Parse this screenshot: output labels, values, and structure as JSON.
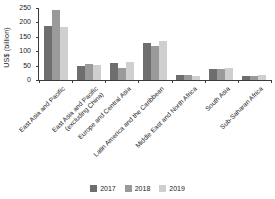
{
  "chart_data": {
    "type": "bar",
    "title": "",
    "xlabel": "",
    "ylabel": "US$ (billion)",
    "ylim": [
      0,
      250
    ],
    "yticks": [
      0,
      50,
      100,
      150,
      200,
      250
    ],
    "grid": false,
    "legend_position": "bottom",
    "categories": [
      "East Asia and Pacific",
      "East Asia and Pacific (excluding China)",
      "Europe and Central Asia",
      "Latin America and the Caribbean",
      "Middle East and North Africa",
      "South Asia",
      "Sub-Saharan Africa"
    ],
    "category_lines": [
      [
        "East Asia and Pacific",
        ""
      ],
      [
        "East Asia and Pacific",
        "(excluding China)"
      ],
      [
        "Europe and Central Asia",
        ""
      ],
      [
        "Latin America and the Caribbean",
        ""
      ],
      [
        "Middle East and North Africa",
        ""
      ],
      [
        "South Asia",
        ""
      ],
      [
        "Sub-Saharan Africa",
        ""
      ]
    ],
    "series": [
      {
        "name": "2017",
        "color": "#6e6e6e",
        "values": [
          188,
          48,
          58,
          128,
          18,
          38,
          15
        ]
      },
      {
        "name": "2018",
        "color": "#9a9a9a",
        "values": [
          243,
          56,
          42,
          118,
          16,
          38,
          13
        ]
      },
      {
        "name": "2019",
        "color": "#cfcfcf",
        "values": [
          183,
          53,
          63,
          134,
          13,
          42,
          17
        ]
      }
    ]
  },
  "legend": {
    "items": [
      {
        "label": "2017",
        "color": "#6e6e6e"
      },
      {
        "label": "2018",
        "color": "#9a9a9a"
      },
      {
        "label": "2019",
        "color": "#cfcfcf"
      }
    ]
  },
  "axis": {
    "y_title": "US$ (billion)",
    "tick_labels": [
      "250",
      "200",
      "150",
      "100",
      "50",
      "0"
    ]
  }
}
